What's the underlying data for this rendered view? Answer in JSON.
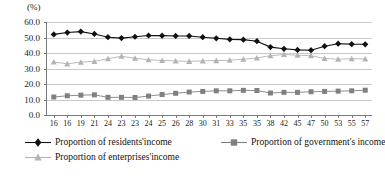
{
  "chart_data": {
    "type": "line",
    "title": "",
    "subtitle": "",
    "unit_label": "(%)",
    "xlabel": "",
    "ylabel": "",
    "ylim": [
      0.0,
      60.0
    ],
    "yticks": [
      "0.0",
      "10.0",
      "20.0",
      "30.0",
      "40.0",
      "50.0",
      "60.0"
    ],
    "ytick_values": [
      0.0,
      10.0,
      20.0,
      30.0,
      40.0,
      50.0,
      60.0
    ],
    "grid": true,
    "legend_position": "bottom-left",
    "categories": [
      "16",
      "16",
      "19",
      "21",
      "24",
      "23",
      "23",
      "24",
      "25",
      "26",
      "28",
      "30",
      "31",
      "33",
      "35",
      "35",
      "38",
      "42",
      "45",
      "47",
      "50",
      "53",
      "55",
      "57"
    ],
    "series": [
      {
        "name": "Proportion of residents'income",
        "marker": "diamond",
        "color": "#111111",
        "values": [
          52.0,
          53.2,
          53.8,
          52.3,
          50.2,
          49.6,
          50.5,
          51.3,
          51.2,
          51.0,
          51.0,
          50.2,
          49.5,
          48.8,
          48.6,
          47.6,
          43.8,
          42.7,
          42.0,
          41.8,
          44.4,
          46.0,
          45.7,
          45.6
        ]
      },
      {
        "name": "Proportion of government's income",
        "marker": "square",
        "color": "#808080",
        "values": [
          11.6,
          12.4,
          12.8,
          13.0,
          11.4,
          11.4,
          11.3,
          12.2,
          13.2,
          14.0,
          14.8,
          15.2,
          15.6,
          15.6,
          15.9,
          15.8,
          14.2,
          14.6,
          14.6,
          15.0,
          15.2,
          15.4,
          15.6,
          16.0
        ]
      },
      {
        "name": "Proportion of enterprises'income",
        "marker": "triangle",
        "color": "#b3b3b3",
        "values": [
          34.2,
          33.0,
          34.1,
          34.6,
          36.3,
          37.9,
          36.6,
          35.6,
          35.2,
          34.9,
          34.6,
          34.9,
          35.1,
          35.4,
          36.0,
          36.8,
          38.3,
          39.0,
          38.6,
          38.2,
          36.5,
          36.0,
          36.3,
          36.2
        ]
      }
    ],
    "colors": {
      "residents": "#111111",
      "government": "#808080",
      "enterprises": "#b3b3b3",
      "grid": "#c9c9c9",
      "axis": "#7a7a7a"
    }
  },
  "legend": {
    "items": [
      {
        "label": "Proportion of residents'income",
        "marker": "diamond",
        "color": "#111111"
      },
      {
        "label": "Proportion of government's income",
        "marker": "square",
        "color": "#808080"
      },
      {
        "label": "Proportion of enterprises'income",
        "marker": "triangle",
        "color": "#b3b3b3"
      }
    ]
  }
}
